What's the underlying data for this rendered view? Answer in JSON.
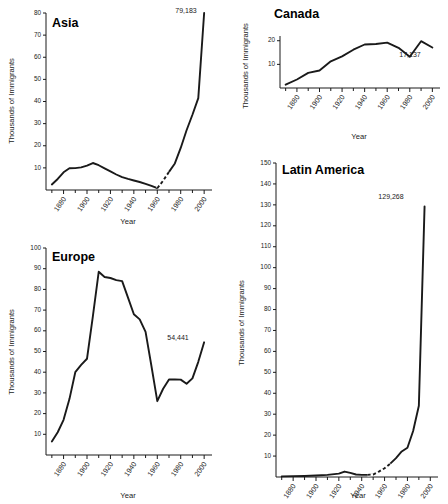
{
  "figure": {
    "xlabel": "Year",
    "ylabel": "Thousands of Immigrants"
  },
  "chart_data": [
    {
      "type": "line",
      "title": "Asia",
      "xlabel": "Year",
      "ylabel": "Thousands of Immigrants",
      "xlim": [
        1865,
        2005
      ],
      "ylim": [
        0,
        80
      ],
      "xticks": [
        1880,
        1900,
        1920,
        1940,
        1960,
        1980,
        2000
      ],
      "yticks": [
        10,
        20,
        30,
        40,
        50,
        60,
        70,
        80
      ],
      "grid": false,
      "legend": "none",
      "annotation": "79,183",
      "annotation_x": 1996,
      "annotation_y": 79.183,
      "x": [
        1870,
        1875,
        1880,
        1885,
        1890,
        1895,
        1900,
        1905,
        1910,
        1915,
        1920,
        1925,
        1930,
        1935,
        1940,
        1945,
        1950,
        1955,
        1960,
        1965,
        1970,
        1975,
        1980,
        1985,
        1990,
        1995,
        2000
      ],
      "values": [
        2.5,
        5.0,
        8.0,
        9.8,
        9.9,
        10.2,
        11.0,
        12.2,
        11.2,
        9.8,
        8.4,
        7.0,
        5.8,
        5.0,
        4.3,
        3.6,
        2.8,
        1.9,
        0.8,
        4.2,
        8.2,
        12.0,
        19.0,
        27.0,
        34.0,
        41.5,
        80.0
      ],
      "dashed_segment_x": [
        1960,
        1965,
        1970
      ],
      "dashed_segment_values": [
        0.8,
        4.2,
        8.2
      ]
    },
    {
      "type": "line",
      "title": "Canada",
      "xlabel": "Year",
      "ylabel": "Thousands of Immigrants",
      "xlim": [
        1865,
        2005
      ],
      "ylim": [
        0,
        22
      ],
      "xticks": [
        1880,
        1900,
        1920,
        1940,
        1960,
        1980,
        2000
      ],
      "yticks": [
        10,
        20
      ],
      "grid": false,
      "legend": "none",
      "annotation": "17,137",
      "annotation_x": 1990,
      "annotation_y": 13.5,
      "x": [
        1870,
        1880,
        1890,
        1900,
        1910,
        1920,
        1930,
        1940,
        1950,
        1960,
        1970,
        1980,
        1990,
        2000
      ],
      "values": [
        1.4,
        3.6,
        6.4,
        7.4,
        11.3,
        13.4,
        16.2,
        18.4,
        18.6,
        19.2,
        17.0,
        13.2,
        19.8,
        17.137
      ]
    },
    {
      "type": "line",
      "title": "Europe",
      "xlabel": "Year",
      "ylabel": "Thousands of Immigrants",
      "xlim": [
        1865,
        2005
      ],
      "ylim": [
        0,
        100
      ],
      "xticks": [
        1880,
        1900,
        1920,
        1940,
        1960,
        1980,
        2000
      ],
      "yticks": [
        10,
        20,
        30,
        40,
        50,
        60,
        70,
        80,
        90,
        100
      ],
      "grid": false,
      "legend": "none",
      "annotation": "54,441",
      "annotation_x": 1988,
      "annotation_y": 56.0,
      "x": [
        1870,
        1875,
        1880,
        1885,
        1890,
        1895,
        1900,
        1905,
        1910,
        1915,
        1920,
        1925,
        1930,
        1935,
        1940,
        1945,
        1950,
        1955,
        1960,
        1965,
        1970,
        1975,
        1980,
        1985,
        1990,
        1995,
        2000
      ],
      "values": [
        6.5,
        11.0,
        17.0,
        27.0,
        40.0,
        43.5,
        46.5,
        67.0,
        88.5,
        86.0,
        85.5,
        84.5,
        84.0,
        76.0,
        68.0,
        65.5,
        59.5,
        43.0,
        26.0,
        32.0,
        36.5,
        36.5,
        36.4,
        34.4,
        37.0,
        45.0,
        54.441
      ]
    },
    {
      "type": "line",
      "title": "Latin America",
      "xlabel": "Year",
      "ylabel": "Thousands of Immigrants",
      "xlim": [
        1865,
        2005
      ],
      "ylim": [
        0,
        150
      ],
      "xticks": [
        1880,
        1900,
        1920,
        1940,
        1960,
        1980,
        2000
      ],
      "yticks": [
        10,
        20,
        30,
        40,
        50,
        60,
        70,
        80,
        90,
        100,
        110,
        120,
        130,
        140,
        150
      ],
      "grid": false,
      "legend": "none",
      "annotation": "129,268",
      "annotation_x": 1984,
      "annotation_y": 131.0,
      "x": [
        1870,
        1880,
        1890,
        1900,
        1910,
        1920,
        1925,
        1930,
        1935,
        1940,
        1945,
        1950,
        1955,
        1960,
        1965,
        1970,
        1975,
        1980,
        1985,
        1990,
        1995
      ],
      "values": [
        0.3,
        0.4,
        0.5,
        0.7,
        1.0,
        1.6,
        2.6,
        2.0,
        1.2,
        1.0,
        1.0,
        1.2,
        2.6,
        4.2,
        6.4,
        9.0,
        12.2,
        14.0,
        22.0,
        34.0,
        129.268
      ],
      "dashed_segment_x": [
        1945,
        1950,
        1955,
        1960,
        1965
      ],
      "dashed_segment_values": [
        1.0,
        1.2,
        2.6,
        4.2,
        6.4
      ]
    }
  ]
}
